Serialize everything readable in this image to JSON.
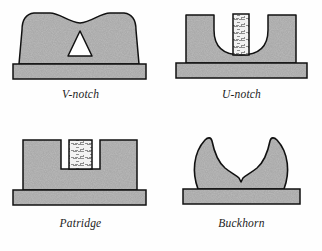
{
  "figure": {
    "background_color": "#fefefe",
    "outline_color": "#111111",
    "fill_color": "#a8a8a8",
    "post_fill_color": "#efefef",
    "notch_cutout_color": "#ffffff",
    "caption_color": "#1c1c1c"
  },
  "panels": [
    {
      "id": "v-notch",
      "caption": "V-notch",
      "position": "top-left",
      "shape_description": "Blade with concave scalloped top edge, rounded upper corners, triangular white cutout notch pointing up, on a wide rectangular base plate",
      "notch_shape": "triangle",
      "has_center_post": false,
      "base_plate": true
    },
    {
      "id": "u-notch",
      "caption": "U-notch",
      "position": "top-right",
      "shape_description": "Rectangular blade with semicircular U cutout and a vertical hatched center post rising from the bottom of the cutout, on a wide rectangular base plate",
      "notch_shape": "semicircle",
      "has_center_post": true,
      "base_plate": true
    },
    {
      "id": "patridge",
      "caption": "Patridge",
      "position": "bottom-left",
      "shape_description": "Rectangular blade with a square rectangular notch and a hatched center post filling the notch, on a wide rectangular base plate",
      "notch_shape": "rectangle",
      "has_center_post": true,
      "base_plate": true
    },
    {
      "id": "buckhorn",
      "caption": "Buckhorn",
      "position": "bottom-right",
      "shape_description": "Blade with two tall inward-curving horns forming a deep rounded opening with a small V notch at the center valley, on a wide rectangular base plate",
      "notch_shape": "buckhorn-v",
      "has_center_post": false,
      "base_plate": true
    }
  ]
}
